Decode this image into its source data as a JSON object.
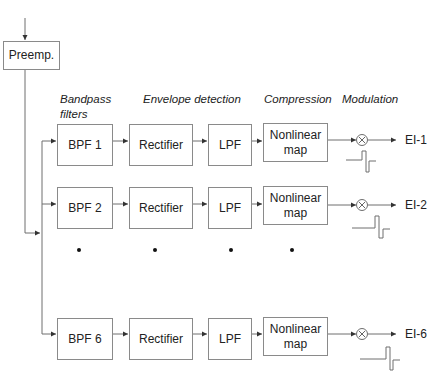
{
  "diagram": {
    "type": "block-diagram",
    "title": "",
    "preemphasis": {
      "label": "Preemp."
    },
    "headers": {
      "bandpass": "Bandpass filters",
      "bandpass_line1": "Bandpass",
      "bandpass_line2": "filters",
      "envelope": "Envelope detection",
      "compression": "Compression",
      "modulation": "Modulation"
    },
    "channels": [
      {
        "bpf": "BPF 1",
        "rectifier": "Rectifier",
        "lpf": "LPF",
        "map_line1": "Nonlinear",
        "map_line2": "map",
        "multiplier": "⊗",
        "output": "EI-1"
      },
      {
        "bpf": "BPF 2",
        "rectifier": "Rectifier",
        "lpf": "LPF",
        "map_line1": "Nonlinear",
        "map_line2": "map",
        "multiplier": "⊗",
        "output": "EI-2"
      },
      {
        "bpf": "BPF 6",
        "rectifier": "Rectifier",
        "lpf": "LPF",
        "map_line1": "Nonlinear",
        "map_line2": "map",
        "multiplier": "⊗",
        "output": "EI-6"
      }
    ],
    "ellipsis": "•",
    "colors": {
      "line": "#6e6e6e",
      "box_border": "#8a8a8a",
      "text": "#222222"
    }
  }
}
